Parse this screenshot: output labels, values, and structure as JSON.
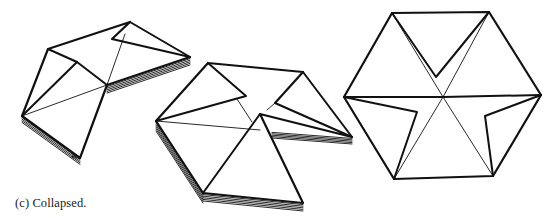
{
  "caption": "(c) Collapsed.",
  "colors": {
    "stroke": "#111111",
    "background": "#ffffff"
  },
  "figures": [
    {
      "id": "shape-partially-folded-left",
      "outline": [
        [
          130,
          22
        ],
        [
          112,
          39
        ],
        [
          190,
          57
        ],
        [
          107,
          85
        ],
        [
          80,
          158
        ],
        [
          22,
          116
        ],
        [
          48,
          49
        ],
        [
          130,
          22
        ]
      ],
      "thick": [
        [
          [
            48,
            49
          ],
          [
            77,
            62
          ],
          [
            107,
            85
          ]
        ],
        [
          [
            22,
            116
          ],
          [
            77,
            62
          ]
        ],
        [
          [
            130,
            22
          ],
          [
            190,
            57
          ]
        ]
      ],
      "thin": [
        [
          [
            22,
            116
          ],
          [
            107,
            85
          ]
        ],
        [
          [
            107,
            85
          ],
          [
            125,
            34
          ]
        ]
      ],
      "stacks": [
        {
          "from": [
            [
              107,
              85
            ],
            [
              190,
              57
            ]
          ],
          "dx": 0,
          "dy": 1.6,
          "count": 5
        },
        {
          "from": [
            [
              107,
              85
            ],
            [
              80,
              158
            ]
          ],
          "dx": -1.6,
          "dy": 0,
          "count": 5
        },
        {
          "from": [
            [
              22,
              116
            ],
            [
              80,
              158
            ]
          ],
          "dx": 0,
          "dy": 1.6,
          "count": 4
        }
      ]
    },
    {
      "id": "shape-partially-folded-middle",
      "outline": [
        [
          208,
          63
        ],
        [
          303,
          72
        ],
        [
          275,
          103
        ],
        [
          352,
          137
        ],
        [
          260,
          114
        ],
        [
          303,
          203
        ],
        [
          203,
          193
        ],
        [
          156,
          121
        ],
        [
          208,
          63
        ]
      ],
      "thick": [
        [
          [
            208,
            63
          ],
          [
            246,
            96
          ],
          [
            156,
            121
          ]
        ],
        [
          [
            303,
            72
          ],
          [
            352,
            137
          ]
        ],
        [
          [
            260,
            114
          ],
          [
            203,
            193
          ]
        ]
      ],
      "thin": [
        [
          [
            156,
            121
          ],
          [
            260,
            130
          ]
        ],
        [
          [
            237,
            99
          ],
          [
            252,
            122
          ]
        ],
        [
          [
            275,
            103
          ],
          [
            267,
            110
          ]
        ]
      ],
      "stacks": [
        {
          "from": [
            [
              156,
              121
            ],
            [
              203,
              193
            ]
          ],
          "dx": 0,
          "dy": 2,
          "count": 5
        },
        {
          "from": [
            [
              203,
              193
            ],
            [
              303,
              203
            ]
          ],
          "dx": 0,
          "dy": 1.6,
          "count": 5
        },
        {
          "from": [
            [
              272,
              131
            ],
            [
              352,
              137
            ]
          ],
          "dx": 0,
          "dy": 1.4,
          "count": 5
        }
      ]
    },
    {
      "id": "shape-hexagon-collapsed",
      "outline": [
        [
          392,
          13
        ],
        [
          489,
          12
        ],
        [
          541,
          95
        ],
        [
          493,
          176
        ],
        [
          394,
          179
        ],
        [
          344,
          97
        ],
        [
          392,
          13
        ]
      ],
      "thick": [
        [
          [
            392,
            13
          ],
          [
            436,
            77
          ],
          [
            489,
            12
          ]
        ],
        [
          [
            344,
            97
          ],
          [
            443,
            97
          ],
          [
            541,
            95
          ]
        ],
        [
          [
            344,
            97
          ],
          [
            417,
            112
          ],
          [
            394,
            179
          ]
        ],
        [
          [
            541,
            95
          ],
          [
            485,
            116
          ],
          [
            493,
            176
          ]
        ]
      ],
      "thin": [
        [
          [
            392,
            13
          ],
          [
            443,
            97
          ]
        ],
        [
          [
            489,
            12
          ],
          [
            443,
            97
          ]
        ],
        [
          [
            443,
            97
          ],
          [
            394,
            179
          ]
        ],
        [
          [
            443,
            97
          ],
          [
            493,
            176
          ]
        ]
      ],
      "stacks": []
    }
  ]
}
